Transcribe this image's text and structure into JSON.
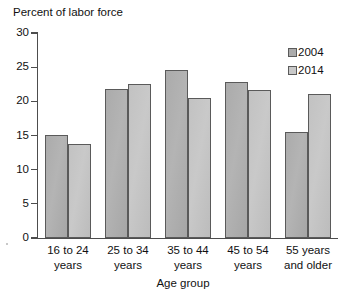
{
  "chart_data": {
    "type": "bar",
    "title": "Percent of labor force",
    "xlabel": "Age group",
    "ylabel": "",
    "categories": [
      "16 to 24\nyears",
      "25 to 34\nyears",
      "35 to 44\nyears",
      "45 to 54\nyears",
      "55 years\nand older"
    ],
    "series": [
      {
        "name": "2004",
        "values": [
          15.1,
          21.8,
          24.6,
          22.9,
          15.5
        ],
        "color": "#ababab"
      },
      {
        "name": "2014",
        "values": [
          13.7,
          22.6,
          20.5,
          21.7,
          21.1
        ],
        "color": "#c9c9c9"
      }
    ],
    "ylim": [
      0,
      30
    ],
    "yticks": [
      0,
      5,
      10,
      15,
      20,
      25,
      30
    ],
    "ytick_labels": [
      "0",
      "5",
      "10",
      "15",
      "20",
      "25",
      "30"
    ],
    "grid": false,
    "legend_position": "top-right"
  },
  "footer": {
    "cropped_text": ""
  }
}
